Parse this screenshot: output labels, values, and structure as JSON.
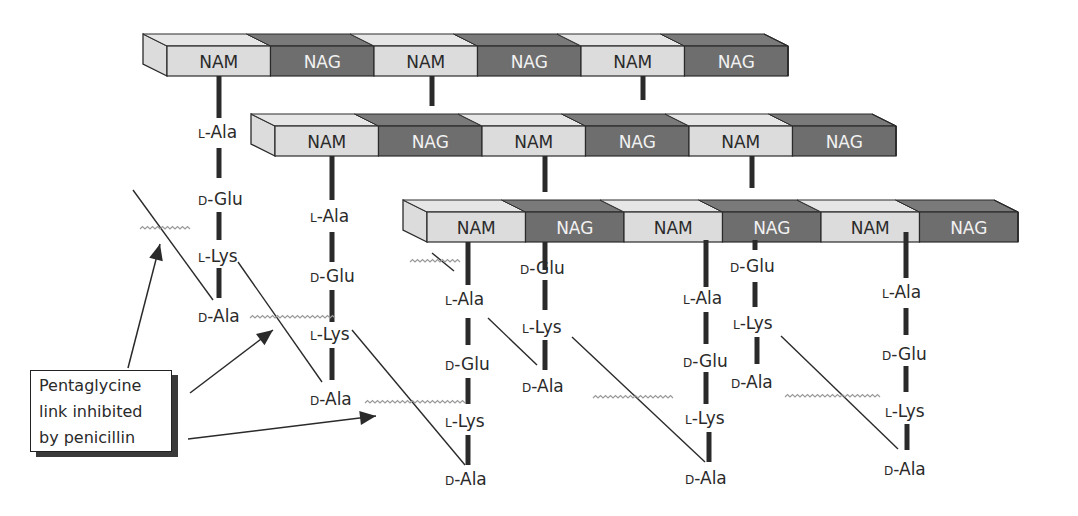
{
  "diagram": {
    "colors": {
      "nam_fill": "#dcdcdc",
      "nam_top": "#e6e6e6",
      "nag_fill": "#6e6e6e",
      "nag_top": "#7a7a7a",
      "nag_text": "#f2f2f2",
      "nam_text": "#2a2a2a",
      "line": "#2a2a2a",
      "wavy": "#9a9a9a"
    },
    "glycan_strands": [
      {
        "id": "strand-1",
        "segments": [
          "NAM",
          "NAG",
          "NAM",
          "NAG",
          "NAM",
          "NAG"
        ]
      },
      {
        "id": "strand-2",
        "segments": [
          "NAM",
          "NAG",
          "NAM",
          "NAG",
          "NAM",
          "NAG"
        ]
      },
      {
        "id": "strand-3",
        "segments": [
          "NAM",
          "NAG",
          "NAM",
          "NAG",
          "NAM",
          "NAG"
        ]
      }
    ],
    "peptide_chains": [
      {
        "id": "chain-a",
        "residues": [
          {
            "p": "L",
            "n": "-Ala"
          },
          {
            "p": "D",
            "n": "-Glu"
          },
          {
            "p": "L",
            "n": "-Lys"
          },
          {
            "p": "D",
            "n": "-Ala"
          }
        ]
      },
      {
        "id": "chain-b",
        "residues": [
          {
            "p": "L",
            "n": "-Ala"
          },
          {
            "p": "D",
            "n": "-Glu"
          },
          {
            "p": "L",
            "n": "-Lys"
          },
          {
            "p": "D",
            "n": "-Ala"
          }
        ]
      },
      {
        "id": "chain-c",
        "residues": [
          {
            "p": "L",
            "n": "-Ala"
          },
          {
            "p": "D",
            "n": "-Glu"
          },
          {
            "p": "L",
            "n": "-Lys"
          },
          {
            "p": "D",
            "n": "-Ala"
          }
        ]
      },
      {
        "id": "chain-d",
        "residues": [
          {
            "p": "D",
            "n": "-Glu"
          },
          {
            "p": "L",
            "n": "-Lys"
          },
          {
            "p": "D",
            "n": "-Ala"
          }
        ]
      },
      {
        "id": "chain-e",
        "residues": [
          {
            "p": "L",
            "n": "-Ala"
          },
          {
            "p": "D",
            "n": "-Glu"
          },
          {
            "p": "L",
            "n": "-Lys"
          },
          {
            "p": "D",
            "n": "-Ala"
          }
        ]
      },
      {
        "id": "chain-f",
        "residues": [
          {
            "p": "D",
            "n": "-Glu"
          },
          {
            "p": "L",
            "n": "-Lys"
          },
          {
            "p": "D",
            "n": "-Ala"
          }
        ]
      },
      {
        "id": "chain-g",
        "residues": [
          {
            "p": "L",
            "n": "-Ala"
          },
          {
            "p": "D",
            "n": "-Glu"
          },
          {
            "p": "L",
            "n": "-Lys"
          },
          {
            "p": "D",
            "n": "-Ala"
          }
        ]
      }
    ],
    "callout": {
      "lines": [
        "Pentaglycine",
        "link inhibited",
        "by penicillin"
      ]
    }
  }
}
